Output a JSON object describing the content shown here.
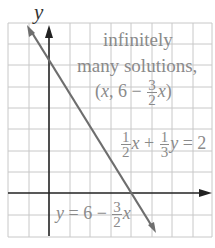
{
  "axes": {
    "y_label": "y",
    "x_axis_y_px": 193,
    "y_axis_x_px": 49,
    "grid_spacing_px": 20.5
  },
  "annotation": {
    "line1": "infinitely",
    "line2": "many solutions,",
    "point_open": "(",
    "point_x": "x",
    "point_mid": ", 6 − ",
    "frac_num": "3",
    "frac_den": "2",
    "point_x2": "x",
    "point_close": ")"
  },
  "equation1": {
    "frac1_num": "1",
    "frac1_den": "2",
    "x": "x",
    "plus": " + ",
    "frac2_num": "1",
    "frac2_den": "3",
    "y": "y",
    "rhs": " = 2"
  },
  "equation2": {
    "y": "y",
    "eq": " = 6 − ",
    "frac_num": "3",
    "frac_den": "2",
    "x": "x"
  },
  "colors": {
    "grid": "#c8c8c8",
    "axis": "#222222",
    "line": "#6e6e6e",
    "text": "#8a8a8a"
  }
}
